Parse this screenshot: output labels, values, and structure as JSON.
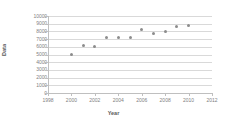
{
  "chart_data": {
    "type": "scatter",
    "title": "",
    "xlabel": "Year",
    "ylabel": "Data",
    "xlim": [
      1998,
      2012
    ],
    "ylim": [
      0,
      10000
    ],
    "grid": true,
    "legend": "none",
    "marker_color": "#8c8c8c",
    "gridline_color": "#d9d9d9",
    "axis_color": "#bfbfbf",
    "xticks": [
      1998,
      2000,
      2002,
      2004,
      2006,
      2008,
      2010,
      2012
    ],
    "xtick_labels": [
      "1998",
      "2000",
      "2002",
      "2004",
      "2006",
      "2008",
      "2010",
      "2012"
    ],
    "yticks": [
      0,
      1000,
      2000,
      3000,
      4000,
      5000,
      6000,
      7000,
      8000,
      9000,
      10000
    ],
    "ytick_labels": [
      "0",
      "1000",
      "2000",
      "3000",
      "4000",
      "5000",
      "6000",
      "7000",
      "8000",
      "9000",
      "10000"
    ],
    "x": [
      2000,
      2001,
      2002,
      2003,
      2004,
      2005,
      2006,
      2007,
      2008,
      2009,
      2010
    ],
    "values": [
      5000,
      6200,
      6050,
      7200,
      7150,
      7200,
      8200,
      7700,
      7950,
      8600,
      8800
    ],
    "points": [
      {
        "x": 2000,
        "y": 5000
      },
      {
        "x": 2001,
        "y": 6200
      },
      {
        "x": 2002,
        "y": 6050
      },
      {
        "x": 2003,
        "y": 7200
      },
      {
        "x": 2004,
        "y": 7150
      },
      {
        "x": 2005,
        "y": 7200
      },
      {
        "x": 2006,
        "y": 8200
      },
      {
        "x": 2007,
        "y": 7700
      },
      {
        "x": 2008,
        "y": 7950
      },
      {
        "x": 2009,
        "y": 8600
      },
      {
        "x": 2010,
        "y": 8800
      }
    ]
  }
}
